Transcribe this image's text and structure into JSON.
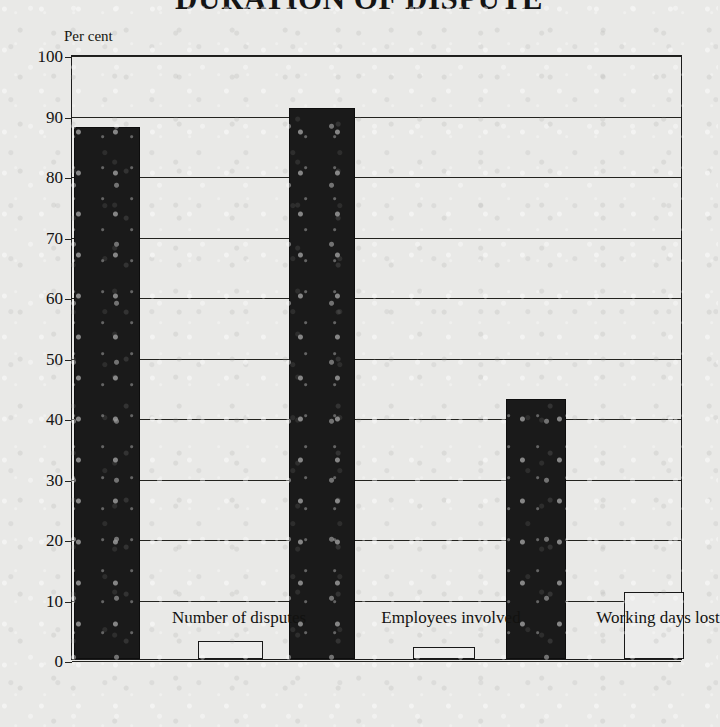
{
  "chart_data": {
    "type": "bar",
    "title": "DURATION OF DISPUTE",
    "xlabel": "",
    "ylabel": "Per cent",
    "ylim": [
      0,
      100
    ],
    "ytick_labels": [
      "0",
      "10",
      "20",
      "30",
      "40",
      "50",
      "60",
      "70",
      "80",
      "90",
      "100"
    ],
    "ytick_values": [
      0,
      10,
      20,
      30,
      40,
      50,
      60,
      70,
      80,
      90,
      100
    ],
    "grid": true,
    "legend": "none",
    "categories": [
      "Number of disputes",
      "Employees involved",
      "Working days lost"
    ],
    "series": [
      {
        "name": "series-1",
        "fill": "black",
        "color": "#1a1a1a",
        "values": [
          88,
          91,
          43
        ]
      },
      {
        "name": "series-2",
        "fill": "grey",
        "color": "#8b8b89",
        "values": [
          10,
          9,
          45
        ]
      },
      {
        "name": "series-3",
        "fill": "white",
        "color": "#ececeb",
        "values": [
          3,
          2,
          11
        ]
      }
    ]
  }
}
